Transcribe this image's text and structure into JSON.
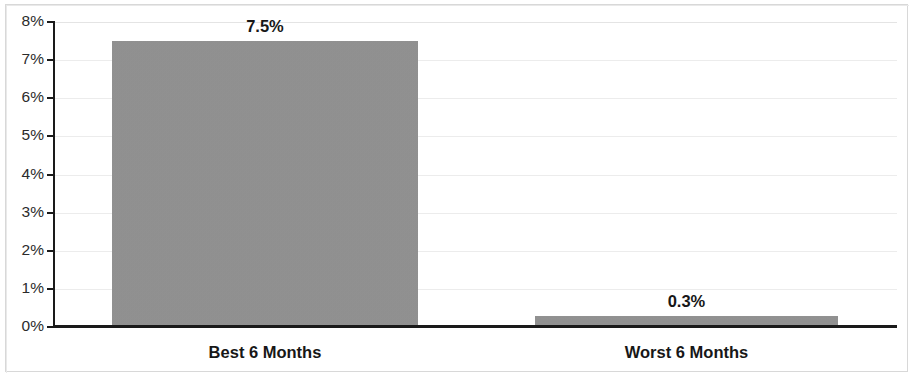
{
  "chart_data": {
    "type": "bar",
    "title": "",
    "subtitle": "",
    "xlabel": "",
    "ylabel": "",
    "categories": [
      "Best 6 Months",
      "Worst 6 Months"
    ],
    "values": [
      7.5,
      0.3
    ],
    "value_labels": [
      "7.5%",
      "0.3%"
    ],
    "ylim": [
      0,
      8
    ],
    "ytick_labels": [
      "8%",
      "7%",
      "6%",
      "5%",
      "4%",
      "3%",
      "2%",
      "1%",
      "0%"
    ],
    "ytick_values": [
      8,
      7,
      6,
      5,
      4,
      3,
      2,
      1,
      0
    ],
    "grid": "horizontal",
    "legend": "none",
    "series": [
      {
        "name": "",
        "values": [
          7.5,
          0.3
        ],
        "color": "#929292"
      }
    ],
    "colors": {
      "bar_fill": "#929292",
      "axis": "#1a1a1a",
      "gridline": "#ececec",
      "label_text": "#171717",
      "tick_text": "#2b2b2b",
      "background": "#ffffff",
      "frame_border": "#d8d8d8"
    }
  }
}
